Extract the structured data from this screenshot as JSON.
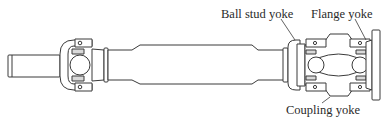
{
  "diagram": {
    "labels": {
      "ball_stud_yoke": "Ball stud yoke",
      "flange_yoke": "Flange yoke",
      "coupling_yoke": "Coupling yoke"
    },
    "colors": {
      "line": "#3a3a3a",
      "fill": "#ffffff",
      "shade": "#d9d9d9",
      "text": "#2a2a2a"
    }
  }
}
